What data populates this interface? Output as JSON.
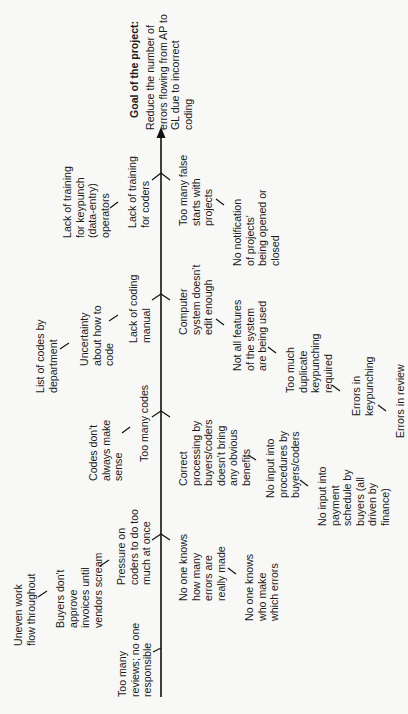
{
  "diagram": {
    "orientation": "rotated 90 degrees counter-clockwise",
    "goal": {
      "title": "Goal of the project:",
      "body": "Reduce the number of\nerrors flowing from AP to\nGL due to incorrect\ncoding"
    },
    "branches": [
      {
        "side": "upper",
        "label": "Lack of training\nfor coders",
        "sub_causes": [
          "Lack of training\nfor keypunch\n(data-entry)\noperators"
        ]
      },
      {
        "side": "lower",
        "label": "Too many false\nstarts with\nprojects",
        "sub_causes": [
          "No notification\nof projects'\nbeing opened or\nclosed"
        ]
      },
      {
        "side": "upper",
        "label": "Lack of coding\nmanual",
        "sub_causes": [
          "Uncertainty\nabout how to\ncode",
          "List of codes by\ndepartment"
        ]
      },
      {
        "side": "lower",
        "label": "Computer\nsystem doesn't\nedit enough",
        "sub_causes": [
          "Not all features\nof the system\nare being used",
          "Too much\nduplicate\nkeypunching\nrequired",
          "Errors in\nkeypunching",
          "Errors in review"
        ]
      },
      {
        "side": "upper",
        "label": "Too many codes",
        "sub_causes": [
          "Codes don't\nalways make\nsense"
        ]
      },
      {
        "side": "lower",
        "label": "Correct\nprocessing by\nbuyers/coders\ndoesn't bring\nany obvious\nbenefits",
        "sub_causes": [
          "No input into\nprocedures by\nbuyers/coders",
          "No input into\npayment\nschedule by\nbuyers (all\ndriven by\nfinance)"
        ]
      },
      {
        "side": "upper",
        "label": "Pressure on\ncoders to do too\nmuch at once",
        "sub_causes": [
          "Buyers don't\napprove\ninvoices until\nvendors scream",
          "Uneven work\nflow throughout"
        ]
      },
      {
        "side": "lower",
        "label": "No one knows\nhow many\nerrors are\nreally made",
        "sub_causes": [
          "No one knows\nwho make\nwhich errors"
        ]
      },
      {
        "side": "upper",
        "label": "Too many\nreviews; no one\nresponsible",
        "sub_causes": []
      }
    ],
    "page_mark": "b"
  }
}
